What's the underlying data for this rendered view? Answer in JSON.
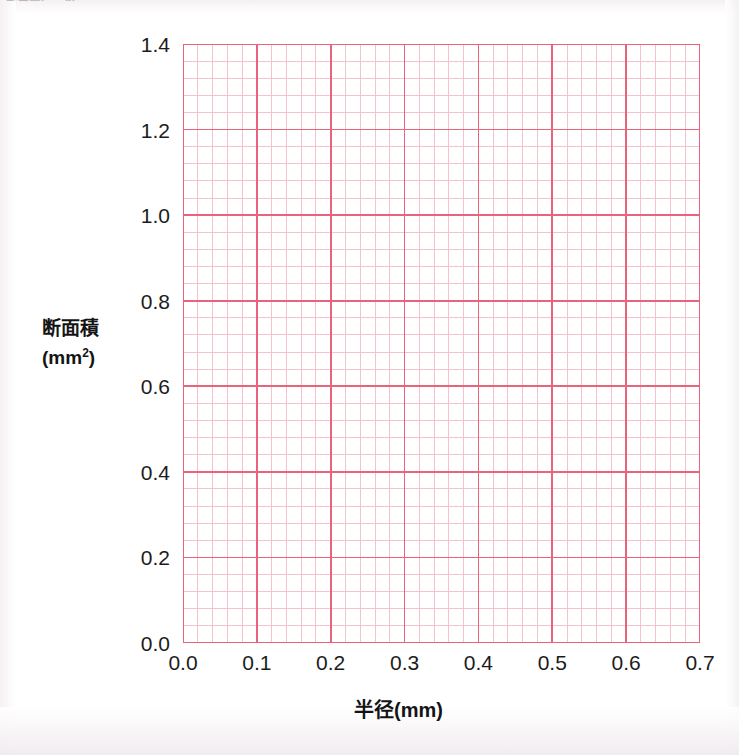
{
  "page": {
    "cropped_header_text": "断面積(mm2)",
    "background_color": "#ffffff"
  },
  "chart_data": {
    "type": "line",
    "title": "",
    "subtitle": "",
    "xlabel": "半径(mm)",
    "ylabel_line1": "断面積",
    "ylabel_line2_pre": "(mm",
    "ylabel_line2_sup": "2",
    "ylabel_line2_post": ")",
    "xlim": [
      0.0,
      0.7
    ],
    "ylim": [
      0.0,
      1.4
    ],
    "x_major_step": 0.1,
    "y_major_step": 0.2,
    "x_minor_divisions": 5,
    "y_minor_divisions": 5,
    "x_tick_labels": [
      "0.0",
      "0.1",
      "0.2",
      "0.3",
      "0.4",
      "0.5",
      "0.6",
      "0.7"
    ],
    "x_tick_values": [
      0.0,
      0.1,
      0.2,
      0.3,
      0.4,
      0.5,
      0.6,
      0.7
    ],
    "y_tick_labels": [
      "0.0",
      "0.2",
      "0.4",
      "0.6",
      "0.8",
      "1.0",
      "1.2",
      "1.4"
    ],
    "y_tick_values": [
      0.0,
      0.2,
      0.4,
      0.6,
      0.8,
      1.0,
      1.2,
      1.4
    ],
    "grid": true,
    "minor_grid": true,
    "legend": false,
    "legend_position": "none",
    "series": [],
    "annotations": [],
    "colors": {
      "grid_major": "#e9637d",
      "grid_minor": "#f6c2cc",
      "axis": "#e9637d",
      "text": "#1c1c1c",
      "plot_background": "#ffffff"
    }
  }
}
